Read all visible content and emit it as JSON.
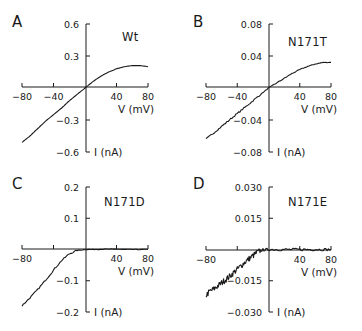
{
  "figure": {
    "panels": [
      {
        "letter": "A",
        "label": "Wt"
      },
      {
        "letter": "B",
        "label": "N171T"
      },
      {
        "letter": "C",
        "label": "N171D"
      },
      {
        "letter": "D",
        "label": "N171E"
      }
    ]
  },
  "chart_data": [
    {
      "type": "line",
      "panel": "A",
      "title": "Wt",
      "xlabel": "V (mV)",
      "ylabel": "I (nA)",
      "xlim": [
        -80,
        80
      ],
      "ylim": [
        -0.6,
        0.6
      ],
      "xticks": [
        -80,
        -40,
        0,
        40,
        80
      ],
      "xtick_labels": [
        "-80",
        "-40",
        "",
        "40",
        "80"
      ],
      "yticks": [
        -0.6,
        -0.3,
        0,
        0.3,
        0.6
      ],
      "ytick_labels": [
        "-0.6",
        "-0.3",
        "",
        "0.3",
        "0.6"
      ],
      "grid": false,
      "noise": 0,
      "series": [
        {
          "name": "Wt",
          "x": [
            -80,
            -70,
            -60,
            -50,
            -40,
            -30,
            -20,
            -10,
            0,
            10,
            20,
            30,
            40,
            50,
            60,
            70,
            80
          ],
          "y": [
            -0.51,
            -0.45,
            -0.38,
            -0.31,
            -0.25,
            -0.19,
            -0.12,
            -0.06,
            0.0,
            0.06,
            0.11,
            0.15,
            0.18,
            0.2,
            0.21,
            0.21,
            0.2
          ]
        }
      ]
    },
    {
      "type": "line",
      "panel": "B",
      "title": "N171T",
      "xlabel": "V (mV)",
      "ylabel": "I (nA)",
      "xlim": [
        -80,
        80
      ],
      "ylim": [
        -0.08,
        0.08
      ],
      "xticks": [
        -80,
        -40,
        0,
        40,
        80
      ],
      "xtick_labels": [
        "-80",
        "-40",
        "",
        "40",
        "80"
      ],
      "yticks": [
        -0.08,
        -0.04,
        0,
        0.04,
        0.08
      ],
      "ytick_labels": [
        "-0.08",
        "-0.04",
        "",
        "0.04",
        "0.08"
      ],
      "grid": false,
      "noise": 0.0006,
      "series": [
        {
          "name": "N171T",
          "x": [
            -80,
            -70,
            -60,
            -50,
            -40,
            -30,
            -20,
            -10,
            0,
            10,
            20,
            30,
            40,
            50,
            60,
            70,
            80
          ],
          "y": [
            -0.064,
            -0.056,
            -0.048,
            -0.04,
            -0.032,
            -0.024,
            -0.016,
            -0.008,
            0.0,
            0.006,
            0.012,
            0.018,
            0.023,
            0.027,
            0.03,
            0.032,
            0.032
          ]
        }
      ]
    },
    {
      "type": "line",
      "panel": "C",
      "title": "N171D",
      "xlabel": "V (mV)",
      "ylabel": "I (nA)",
      "xlim": [
        -80,
        80
      ],
      "ylim": [
        -0.2,
        0.2
      ],
      "xticks": [
        -80,
        -40,
        0,
        40,
        80
      ],
      "xtick_labels": [
        "-80",
        "",
        "",
        "40",
        "80"
      ],
      "yticks": [
        -0.2,
        -0.1,
        0,
        0.1,
        0.2
      ],
      "ytick_labels": [
        "-0.2",
        "-0.1",
        "",
        "0.1",
        "0.2"
      ],
      "grid": false,
      "noise": 0.0015,
      "series": [
        {
          "name": "N171D",
          "x": [
            -80,
            -70,
            -60,
            -50,
            -40,
            -30,
            -20,
            -10,
            0,
            10,
            20,
            30,
            40,
            50,
            60,
            70,
            80
          ],
          "y": [
            -0.18,
            -0.155,
            -0.128,
            -0.098,
            -0.066,
            -0.036,
            -0.014,
            -0.003,
            0.0,
            0.0,
            0.001,
            0.001,
            0.001,
            0.0,
            0.0,
            0.0,
            0.0
          ]
        }
      ]
    },
    {
      "type": "line",
      "panel": "D",
      "title": "N171E",
      "xlabel": "V (mV)",
      "ylabel": "I (nA)",
      "xlim": [
        -80,
        80
      ],
      "ylim": [
        -0.03,
        0.03
      ],
      "xticks": [
        -80,
        -40,
        0,
        40,
        80
      ],
      "xtick_labels": [
        "-80",
        "",
        "",
        "40",
        "80"
      ],
      "yticks": [
        -0.03,
        -0.015,
        0,
        0.015,
        0.03
      ],
      "ytick_labels": [
        "-0.030",
        "-0.015",
        "",
        "0.015",
        "0.030"
      ],
      "grid": false,
      "noise": 0.0009,
      "series": [
        {
          "name": "N171E",
          "x": [
            -80,
            -75,
            -70,
            -65,
            -60,
            -55,
            -50,
            -45,
            -40,
            -35,
            -30,
            -25,
            -20,
            -15,
            -10,
            -5,
            0,
            10,
            20,
            30,
            40,
            50,
            60,
            70,
            80
          ],
          "y": [
            -0.022,
            -0.02,
            -0.019,
            -0.0175,
            -0.016,
            -0.0145,
            -0.013,
            -0.0112,
            -0.0095,
            -0.0078,
            -0.006,
            -0.0045,
            -0.003,
            -0.0015,
            -0.0005,
            -0.0001,
            0.0,
            0.0,
            0.0,
            0.0,
            0.0,
            0.0,
            0.0,
            0.0,
            0.0
          ]
        }
      ]
    }
  ]
}
